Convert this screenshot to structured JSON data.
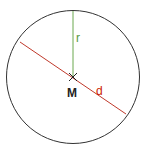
{
  "diagram": {
    "labels": {
      "radius": "r",
      "diameter": "d",
      "center": "M"
    },
    "colors": {
      "circle": "#333333",
      "radius": "#6aa84f",
      "diameter": "#c0392b",
      "center": "#222222",
      "radius_label": "#5a9a3f",
      "diameter_label": "#cc2200"
    }
  }
}
